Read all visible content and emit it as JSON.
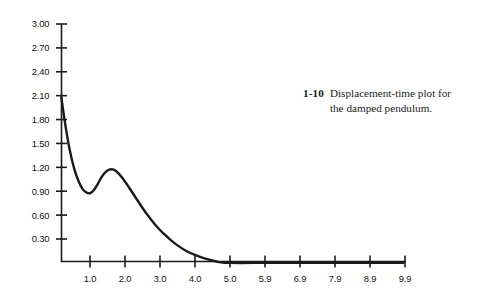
{
  "caption": {
    "number": "1-10",
    "text": "Displacement-time plot for the damped pendulum."
  },
  "colors": {
    "curve": "#1a1a1a",
    "axis": "#1a1a1a",
    "text": "#141414",
    "background": "#ffffff"
  },
  "chart_data": {
    "type": "line",
    "title": "Displacement-time plot for the damped pendulum.",
    "xlabel": "",
    "ylabel": "",
    "xlim": [
      0.0,
      10.0
    ],
    "ylim": [
      0.0,
      3.0
    ],
    "grid": false,
    "legend": "none",
    "x_ticks": [
      1.0,
      2.0,
      3.0,
      4.0,
      5.0,
      5.9,
      6.9,
      7.9,
      8.9,
      9.9
    ],
    "x_tick_labels": [
      "1.0",
      "2.0",
      "3.0",
      "4.0",
      "5.0",
      "5.9",
      "6.9",
      "7.9",
      "8.9",
      "9.9"
    ],
    "y_ticks": [
      0.3,
      0.6,
      0.9,
      1.2,
      1.5,
      1.8,
      2.1,
      2.4,
      2.7,
      3.0
    ],
    "y_tick_labels": [
      "0.30",
      "0.60",
      "0.90",
      "1.20",
      "1.50",
      "1.80",
      "2.10",
      "2.40",
      "2.70",
      "3.00"
    ],
    "series": [
      {
        "name": "displacement",
        "x": [
          0.18,
          0.3,
          0.42,
          0.55,
          0.68,
          0.8,
          0.92,
          1.02,
          1.12,
          1.22,
          1.32,
          1.42,
          1.55,
          1.68,
          1.8,
          1.92,
          2.05,
          2.2,
          2.35,
          2.5,
          2.7,
          2.9,
          3.1,
          3.3,
          3.5,
          3.75,
          4.0,
          4.25,
          4.5,
          4.7,
          5.0,
          6.0,
          7.0,
          8.0,
          9.0,
          9.95
        ],
        "y": [
          2.08,
          1.72,
          1.42,
          1.18,
          1.02,
          0.92,
          0.88,
          0.88,
          0.92,
          0.99,
          1.07,
          1.13,
          1.17,
          1.17,
          1.13,
          1.07,
          0.99,
          0.89,
          0.79,
          0.69,
          0.57,
          0.46,
          0.37,
          0.29,
          0.22,
          0.15,
          0.1,
          0.06,
          0.03,
          0.01,
          0.0,
          0.0,
          0.0,
          0.0,
          0.0,
          0.0
        ]
      }
    ]
  }
}
